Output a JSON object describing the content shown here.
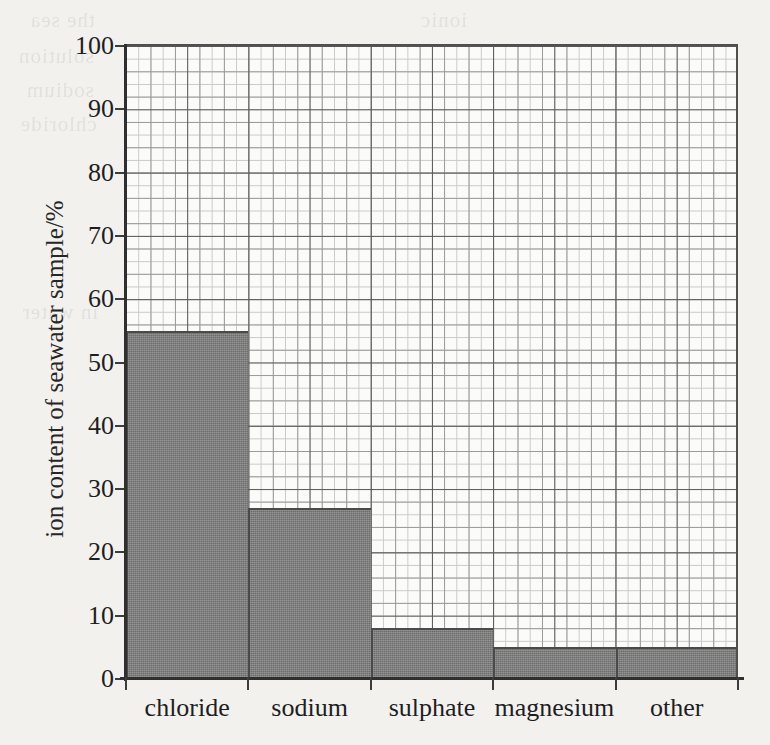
{
  "chart_data": {
    "type": "bar",
    "title": "",
    "subtitle": "",
    "xlabel": "",
    "ylabel": "ion content of seawater sample/%",
    "categories": [
      "chloride",
      "sodium",
      "sulphate",
      "magnesium",
      "other"
    ],
    "values": [
      55,
      27,
      8,
      5,
      5
    ],
    "series": [
      {
        "name": "ion content of seawater sample/%",
        "values": [
          55,
          27,
          8,
          5,
          5
        ]
      }
    ],
    "ylim": [
      0,
      100
    ],
    "y_ticks": [
      0,
      10,
      20,
      30,
      40,
      50,
      60,
      70,
      80,
      90,
      100
    ],
    "y_tick_labels": [
      "0",
      "10",
      "20",
      "30",
      "40",
      "50",
      "60",
      "70",
      "80",
      "90",
      "100"
    ],
    "grid": true,
    "grid_description": "graph-paper grid: minor squares every 2%, medium lines every 4%, heavy lines every 10%",
    "legend": false,
    "legend_position": "none",
    "bar_gap": 0,
    "annotations": [],
    "colors": {
      "bar_fill": "#7d7d7d",
      "bar_edge": "#4a4a4a",
      "axis": "#2f2f2f",
      "grid_minor": "#c9c9c9",
      "grid_mid": "#9a9a9a",
      "grid_major": "#585858",
      "plot_background": "#fbfbfa",
      "page_background": "#f2f1ee",
      "text": "#1e1e1e"
    }
  },
  "axis": {
    "y_title": "ion content of seawater sample/%"
  },
  "bleed_through": {
    "lines": [
      "the sea",
      "ionic",
      "solution",
      "sodium",
      "chloride",
      "in water"
    ]
  }
}
